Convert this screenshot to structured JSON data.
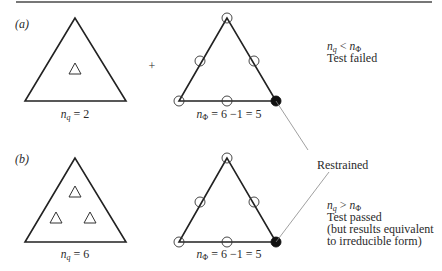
{
  "figure": {
    "panel_a": {
      "label": "(a)",
      "left_caption": {
        "var": "n",
        "sub": "q",
        "rest": " = 2"
      },
      "plus_sign": "+",
      "right_caption": {
        "var": "n",
        "sub": "Φ",
        "rest": " = 6 −1 = 5"
      },
      "condition": {
        "lhs_var": "n",
        "lhs_sub": "q",
        "op": " < ",
        "rhs_var": "n",
        "rhs_sub": "Φ"
      },
      "result": "Test failed"
    },
    "panel_b": {
      "label": "(b)",
      "left_caption": {
        "var": "n",
        "sub": "q",
        "rest": " = 6"
      },
      "right_caption": {
        "var": "n",
        "sub": "Φ",
        "rest": " = 6 −1 = 5"
      },
      "condition": {
        "lhs_var": "n",
        "lhs_sub": "q",
        "op": " > ",
        "rhs_var": "n",
        "rhs_sub": "Φ"
      },
      "result_lines": [
        "Test passed",
        "(but results equivalent",
        "to irreducible form)"
      ]
    },
    "annotation": "Restrained",
    "colors": {
      "stroke": "#222222",
      "text": "#2a2a2a",
      "rule": "#777777",
      "leader": "#888888"
    },
    "legend_icons": {
      "open_circle": "open-node-icon",
      "filled_circle": "restrained-node-icon",
      "small_triangle": "interior-node-icon"
    }
  }
}
